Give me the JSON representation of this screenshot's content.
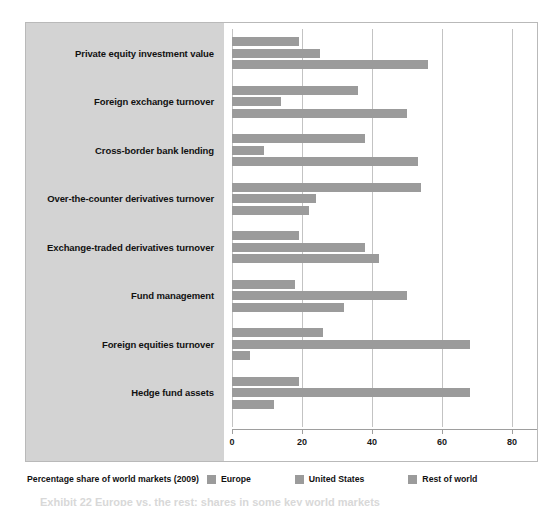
{
  "chart_data": {
    "type": "bar",
    "orientation": "horizontal",
    "title": "",
    "xlabel": "",
    "ylabel": "",
    "xlim": [
      0,
      80
    ],
    "xticks": [
      0,
      20,
      40,
      60,
      80
    ],
    "grid": true,
    "legend_position": "bottom",
    "legend_title": "Percentage share of world markets (2009)",
    "categories": [
      "Private equity investment value",
      "Foreign exchange turnover",
      "Cross-border bank lending",
      "Over-the-counter derivatives turnover",
      "Exchange-traded derivatives turnover",
      "Fund management",
      "Foreign equities turnover",
      "Hedge fund assets"
    ],
    "series": [
      {
        "name": "Europe",
        "color": "#9b9b9b",
        "values": [
          19,
          36,
          38,
          54,
          19,
          18,
          26,
          19
        ]
      },
      {
        "name": "United States",
        "color": "#9b9b9b",
        "values": [
          25,
          14,
          9,
          24,
          38,
          50,
          68,
          68
        ]
      },
      {
        "name": "Rest of world",
        "color": "#9b9b9b",
        "values": [
          56,
          50,
          53,
          22,
          42,
          32,
          5,
          12
        ]
      }
    ]
  },
  "legend": {
    "title": "Percentage share of world markets (2009)",
    "entries": [
      "Europe",
      "United States",
      "Rest of world"
    ]
  },
  "caption": "Exhibit 22 Europe vs. the rest: shares in some key world markets"
}
